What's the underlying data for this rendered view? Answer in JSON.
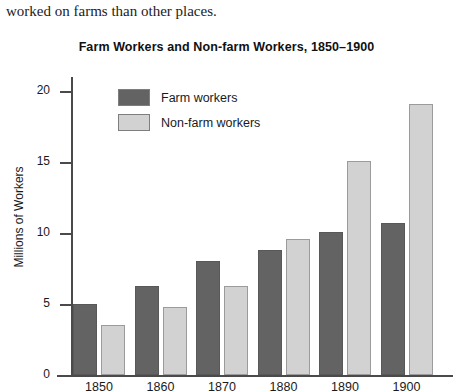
{
  "body_text": "worked on farms than other places.",
  "chart_data": {
    "type": "bar",
    "title": "Farm Workers and Non-farm Workers, 1850–1900",
    "xlabel": "",
    "ylabel": "Millions of Workers",
    "categories": [
      "1850",
      "1860",
      "1870",
      "1880",
      "1890",
      "1900"
    ],
    "series": [
      {
        "name": "Farm workers",
        "color": "#636363",
        "values": [
          5.0,
          6.3,
          8.0,
          8.8,
          10.1,
          10.7
        ]
      },
      {
        "name": "Non-farm workers",
        "color": "#d2d2d2",
        "values": [
          3.5,
          4.8,
          6.3,
          9.6,
          15.1,
          19.1
        ]
      }
    ],
    "ylim": [
      0,
      21
    ],
    "yticks": [
      0,
      5,
      10,
      15,
      20
    ],
    "ytick_labels": [
      "0",
      "5",
      "10",
      "15",
      "20"
    ],
    "grid": false,
    "legend_position": "top-left-inside"
  }
}
